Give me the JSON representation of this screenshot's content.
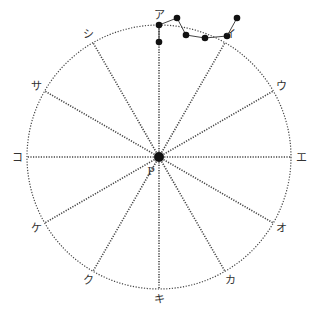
{
  "diagram": {
    "center": {
      "x": 159,
      "y": 157
    },
    "radius": 132,
    "center_label": "P",
    "spokes": [
      {
        "label": "ア",
        "angle": 90
      },
      {
        "label": "イ",
        "angle": 60
      },
      {
        "label": "ウ",
        "angle": 30
      },
      {
        "label": "エ",
        "angle": 0
      },
      {
        "label": "オ",
        "angle": -30
      },
      {
        "label": "カ",
        "angle": -60
      },
      {
        "label": "キ",
        "angle": -90
      },
      {
        "label": "ク",
        "angle": -120
      },
      {
        "label": "ケ",
        "angle": -150
      },
      {
        "label": "コ",
        "angle": 180
      },
      {
        "label": "サ",
        "angle": 150
      },
      {
        "label": "シ",
        "angle": 120
      }
    ],
    "path_points": [
      {
        "x": 159,
        "y": 42
      },
      {
        "x": 159,
        "y": 25
      },
      {
        "x": 177,
        "y": 18
      },
      {
        "x": 186,
        "y": 35
      },
      {
        "x": 205,
        "y": 38
      },
      {
        "x": 227,
        "y": 36
      },
      {
        "x": 237,
        "y": 18
      }
    ],
    "colors": {
      "line": "#333333",
      "dot": "#111111"
    }
  }
}
